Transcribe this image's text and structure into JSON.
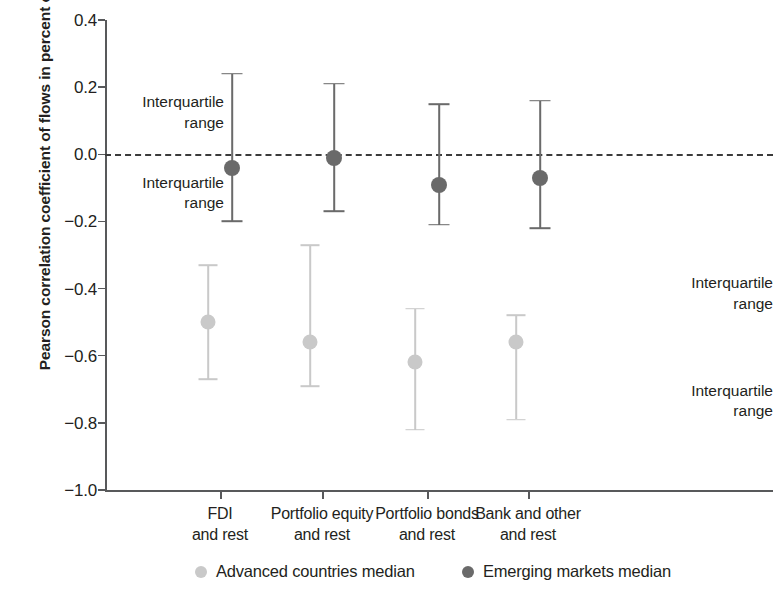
{
  "chart_data": {
    "type": "scatter",
    "title": "",
    "xlabel": "",
    "ylabel": "Pearson correlation\ncoefficient of flows in percent of GDP",
    "ylim": [
      -1.0,
      0.4
    ],
    "ytick_labels": [
      "0.4",
      "0.2",
      "0.0",
      "-0.2",
      "-0.4",
      "-0.6",
      "-0.8",
      "-1.0"
    ],
    "ytick_values": [
      0.4,
      0.2,
      0.0,
      -0.2,
      -0.4,
      -0.6,
      -0.8,
      -1.0
    ],
    "grid": false,
    "zero_reference_line": 0.0,
    "legend_position": "bottom",
    "categories": [
      "FDI\nand rest",
      "Portfolio equity\nand rest",
      "Portfolio bonds\nand rest",
      "Bank and other\nand rest"
    ],
    "series": [
      {
        "name": "Advanced countries median",
        "color": "#c9c9c9",
        "values": [
          -0.5,
          -0.56,
          -0.62,
          -0.56
        ],
        "interquartile_low": [
          -0.67,
          -0.69,
          -0.82,
          -0.79
        ],
        "interquartile_high": [
          -0.33,
          -0.27,
          -0.46,
          -0.48
        ]
      },
      {
        "name": "Emerging markets median",
        "color": "#6a6a6a",
        "values": [
          -0.04,
          -0.01,
          -0.09,
          -0.07
        ],
        "interquartile_low": [
          -0.2,
          -0.17,
          -0.21,
          -0.22
        ],
        "interquartile_high": [
          0.24,
          0.21,
          0.15,
          0.16
        ]
      }
    ],
    "annotations": [
      {
        "text": "Interquartile\nrange",
        "side": "left",
        "target_y": 0.12,
        "id": "annot-em-upper-iqr"
      },
      {
        "text": "Interquartile\nrange",
        "side": "left",
        "target_y": -0.12,
        "id": "annot-em-lower-iqr"
      },
      {
        "text": "Interquartile\nrange",
        "side": "right",
        "target_y": -0.42,
        "id": "annot-adv-upper-iqr"
      },
      {
        "text": "Interquartile\nrange",
        "side": "right",
        "target_y": -0.74,
        "id": "annot-adv-lower-iqr"
      }
    ]
  }
}
